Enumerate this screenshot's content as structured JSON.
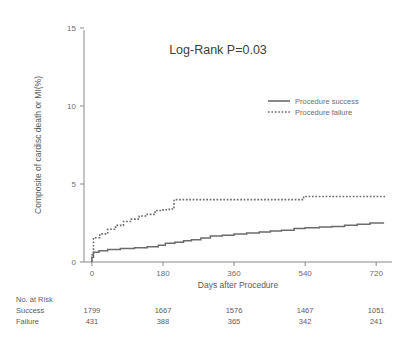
{
  "chart_data": {
    "type": "line",
    "title": "Log-Rank P=0.03",
    "xlabel": "Days after Procedure",
    "ylabel": "Composite of cardisc death or MI(%)",
    "xlim": [
      -20,
      760
    ],
    "ylim": [
      0,
      15
    ],
    "xticks": [
      0,
      180,
      360,
      540,
      720
    ],
    "xtick_labels": [
      "0",
      "180",
      "360",
      "540",
      "720"
    ],
    "yticks": [
      0,
      5,
      10,
      15
    ],
    "ytick_labels": [
      "0",
      "5",
      "10",
      "15"
    ],
    "grid": false,
    "legend_position": "upper right",
    "line_color": "#6b6b6b",
    "axis_color": "#8a8a8a",
    "series": [
      {
        "name": "Procedure success",
        "style": "solid",
        "points": [
          [
            0,
            0.0
          ],
          [
            0,
            0.3
          ],
          [
            4,
            0.62
          ],
          [
            18,
            0.72
          ],
          [
            40,
            0.8
          ],
          [
            72,
            0.86
          ],
          [
            108,
            0.92
          ],
          [
            140,
            0.98
          ],
          [
            168,
            1.08
          ],
          [
            186,
            1.2
          ],
          [
            210,
            1.26
          ],
          [
            232,
            1.36
          ],
          [
            252,
            1.42
          ],
          [
            276,
            1.54
          ],
          [
            300,
            1.66
          ],
          [
            330,
            1.72
          ],
          [
            360,
            1.8
          ],
          [
            392,
            1.86
          ],
          [
            424,
            1.92
          ],
          [
            452,
            1.98
          ],
          [
            480,
            2.04
          ],
          [
            512,
            2.14
          ],
          [
            540,
            2.2
          ],
          [
            576,
            2.24
          ],
          [
            608,
            2.28
          ],
          [
            640,
            2.36
          ],
          [
            672,
            2.42
          ],
          [
            704,
            2.5
          ],
          [
            740,
            2.5
          ]
        ]
      },
      {
        "name": "Procedure failure",
        "style": "dotted",
        "points": [
          [
            0,
            0.0
          ],
          [
            0,
            0.45
          ],
          [
            4,
            1.55
          ],
          [
            20,
            1.8
          ],
          [
            40,
            2.1
          ],
          [
            60,
            2.35
          ],
          [
            80,
            2.6
          ],
          [
            100,
            2.75
          ],
          [
            120,
            2.95
          ],
          [
            140,
            3.05
          ],
          [
            160,
            3.3
          ],
          [
            180,
            3.35
          ],
          [
            196,
            3.4
          ],
          [
            208,
            4.0
          ],
          [
            300,
            4.0
          ],
          [
            400,
            4.0
          ],
          [
            500,
            4.0
          ],
          [
            524,
            4.0
          ],
          [
            536,
            4.2
          ],
          [
            620,
            4.2
          ],
          [
            700,
            4.2
          ],
          [
            745,
            4.2
          ]
        ]
      }
    ]
  },
  "risk_table": {
    "header": "No. at Risk",
    "rows": [
      {
        "label": "Success",
        "values": [
          "1799",
          "1667",
          "1576",
          "1467",
          "1051"
        ]
      },
      {
        "label": "Failure",
        "values": [
          "431",
          "388",
          "365",
          "342",
          "241"
        ]
      }
    ],
    "positions": [
      0,
      180,
      360,
      540,
      720
    ]
  }
}
